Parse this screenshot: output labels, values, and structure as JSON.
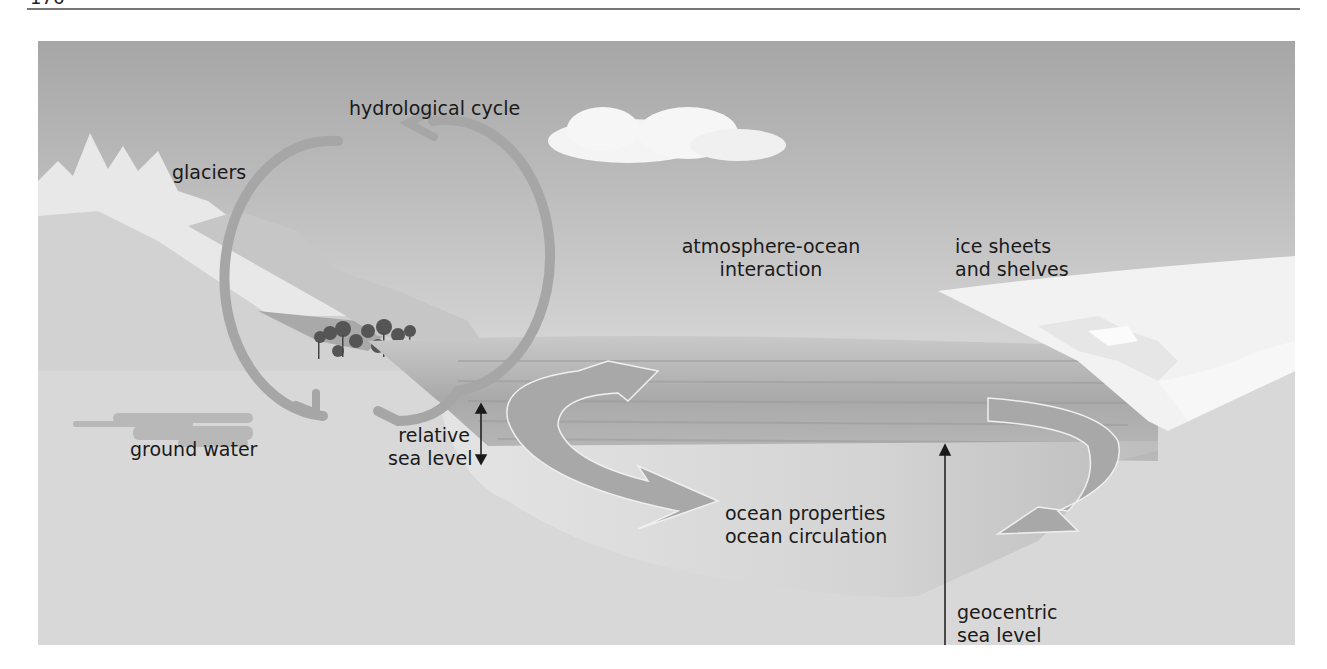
{
  "page": {
    "page_number": "176"
  },
  "figure": {
    "labels": {
      "hydrological_cycle": "hydrological cycle",
      "glaciers": "glaciers",
      "ground_water": "ground water",
      "relative_sea_level_1": "relative",
      "relative_sea_level_2": "sea level",
      "atmosphere_ocean_1": "atmosphere-ocean",
      "atmosphere_ocean_2": "interaction",
      "ice_sheets_1": "ice sheets",
      "ice_sheets_2": "and shelves",
      "ocean_properties": "ocean properties",
      "ocean_circulation": "ocean circulation",
      "geocentric_1": "geocentric",
      "geocentric_2": "sea level"
    },
    "colors": {
      "sky_top": "#a9a9a9",
      "sky_bottom": "#f2f2f2",
      "sea": "#b5b5b5",
      "ocean_body": "#cfcfcf",
      "ground": "#d6d6d6",
      "arrow": "#a3a3a3",
      "text": "#1a1a1a"
    }
  }
}
